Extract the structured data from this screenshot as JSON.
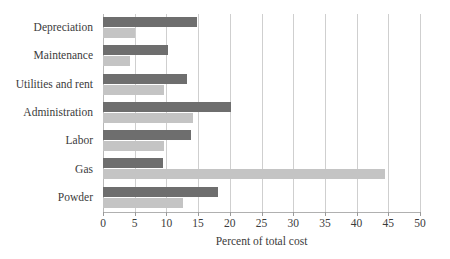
{
  "chart_data": {
    "type": "bar",
    "orientation": "horizontal",
    "title": "",
    "xlabel": "Percent of total cost",
    "ylabel": "",
    "xlim": [
      0,
      50
    ],
    "xticks": [
      0,
      5,
      10,
      15,
      20,
      25,
      30,
      35,
      40,
      45,
      50
    ],
    "grid": "vertical",
    "legend": "none",
    "categories": [
      "Depreciation",
      "Maintenance",
      "Utilities and rent",
      "Administration",
      "Labor",
      "Gas",
      "Powder"
    ],
    "series": [
      {
        "name": "dark-series",
        "color": "#6e6e6e",
        "values": [
          14.8,
          10.3,
          13.2,
          20.2,
          13.9,
          9.5,
          18.1
        ]
      },
      {
        "name": "light-series",
        "color": "#c4c4c4",
        "values": [
          5.0,
          4.3,
          9.6,
          14.2,
          9.6,
          44.5,
          12.6
        ]
      }
    ]
  },
  "colors": {
    "dark_bar": "#6e6e6e",
    "light_bar": "#c4c4c4",
    "gridline": "#cfcfcf",
    "axis": "#b0b0b0",
    "text": "#3b3b3b",
    "background": "#ffffff"
  }
}
